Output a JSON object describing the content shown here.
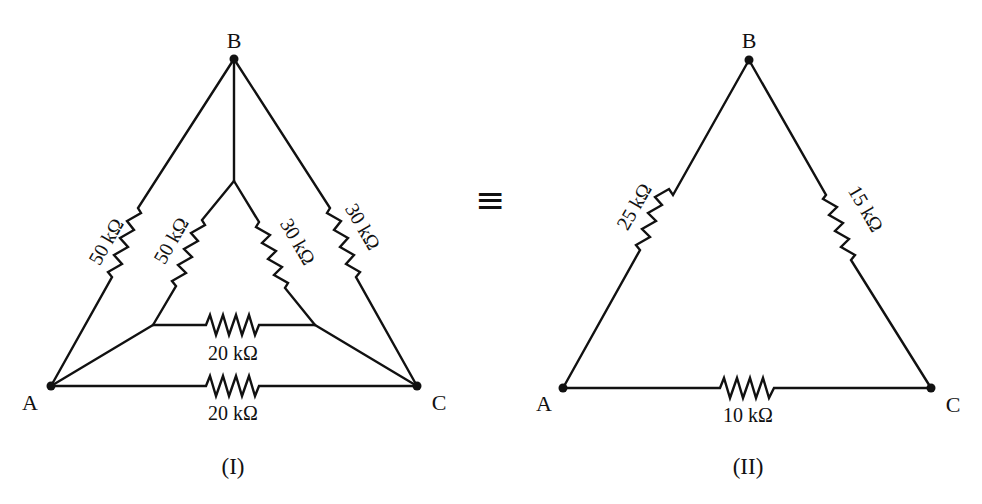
{
  "figure": {
    "equivalence_symbol": "≡",
    "colors": {
      "ink": "#111111",
      "background": "#ffffff"
    }
  },
  "circuit_I": {
    "caption": "(I)",
    "nodes": {
      "A": {
        "label": "A",
        "x": 51,
        "y": 386
      },
      "B": {
        "label": "B",
        "x": 234,
        "y": 59
      },
      "C": {
        "label": "C",
        "x": 417,
        "y": 386
      },
      "P": {
        "x": 234,
        "y": 181
      },
      "Q": {
        "x": 153,
        "y": 325
      },
      "R": {
        "x": 315,
        "y": 325
      }
    },
    "resistors": [
      {
        "id": "outer_AB",
        "from": "A",
        "to": "B",
        "value": "50 kΩ"
      },
      {
        "id": "inner_QP",
        "from": "Q",
        "to": "P",
        "value": "50 kΩ"
      },
      {
        "id": "inner_PR",
        "from": "P",
        "to": "R",
        "value": "30 kΩ"
      },
      {
        "id": "outer_BC",
        "from": "B",
        "to": "C",
        "value": "30 kΩ"
      },
      {
        "id": "inner_QR",
        "from": "Q",
        "to": "R",
        "value": "20 kΩ"
      },
      {
        "id": "outer_AC",
        "from": "A",
        "to": "C",
        "value": "20 kΩ"
      }
    ],
    "wires": [
      {
        "from": "B",
        "to": "P"
      },
      {
        "from": "A",
        "to": "Q"
      },
      {
        "from": "C",
        "to": "R"
      }
    ]
  },
  "circuit_II": {
    "caption": "(II)",
    "nodes": {
      "A": {
        "label": "A",
        "x": 563,
        "y": 388
      },
      "B": {
        "label": "B",
        "x": 749,
        "y": 60
      },
      "C": {
        "label": "C",
        "x": 931,
        "y": 388
      }
    },
    "resistors": [
      {
        "id": "AB",
        "from": "A",
        "to": "B",
        "value": "25 kΩ"
      },
      {
        "id": "BC",
        "from": "B",
        "to": "C",
        "value": "15 kΩ"
      },
      {
        "id": "AC",
        "from": "A",
        "to": "C",
        "value": "10 kΩ"
      }
    ]
  }
}
